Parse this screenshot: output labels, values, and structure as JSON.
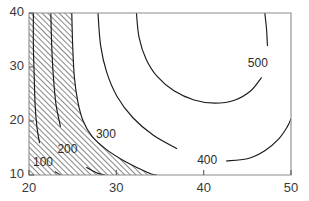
{
  "figure": {
    "kind": "contour-plot",
    "background_color": "#ffffff",
    "frame_color": "#8c8c8c",
    "contour_color": "#1a1a1a",
    "label_color": "#2b2b2b",
    "hatch_angle_degrees": 45,
    "hatch_spacing_px": 4
  },
  "chart_data": {
    "type": "line",
    "subtype": "contour",
    "title": "",
    "subtitle": "",
    "xlabel": "",
    "ylabel": "",
    "xlim": [
      20,
      50
    ],
    "ylim": [
      10,
      40
    ],
    "xticks": [
      20,
      30,
      40,
      50
    ],
    "yticks": [
      10,
      20,
      30,
      40
    ],
    "xtick_labels": [
      "20",
      "30",
      "40",
      "50"
    ],
    "ytick_labels": [
      "10",
      "20",
      "30",
      "40"
    ],
    "grid": false,
    "legend": false,
    "legend_position": "none",
    "contour_levels": [
      100,
      200,
      300,
      400,
      500
    ],
    "level_labels": [
      "100",
      "200",
      "300",
      "400",
      "500"
    ],
    "hatched_levels": [
      100,
      200,
      300
    ],
    "hatched_region_note": "region left of and below the 300 contour is hatched",
    "series": [
      {
        "name": "100",
        "label": "100",
        "label_xy": [
          21.6,
          12.2
        ],
        "points": [
          [
            20.5,
            40.0
          ],
          [
            20.5,
            34.0
          ],
          [
            20.6,
            28.0
          ],
          [
            20.7,
            23.0
          ],
          [
            20.9,
            19.0
          ],
          [
            21.2,
            16.0
          ],
          [
            21.7,
            13.6
          ],
          [
            22.3,
            11.8
          ],
          [
            23.0,
            10.6
          ],
          [
            23.6,
            10.0
          ]
        ]
      },
      {
        "name": "200",
        "label": "200",
        "label_xy": [
          24.4,
          14.6
        ],
        "points": [
          [
            22.5,
            40.0
          ],
          [
            22.6,
            34.0
          ],
          [
            22.8,
            28.0
          ],
          [
            23.1,
            23.0
          ],
          [
            23.6,
            19.0
          ],
          [
            24.3,
            15.8
          ],
          [
            25.3,
            13.2
          ],
          [
            26.6,
            11.4
          ],
          [
            27.9,
            10.3
          ],
          [
            28.7,
            10.0
          ]
        ]
      },
      {
        "name": "300",
        "label": "300",
        "label_xy": [
          28.8,
          17.4
        ],
        "points": [
          [
            24.9,
            40.0
          ],
          [
            25.0,
            34.0
          ],
          [
            25.2,
            28.0
          ],
          [
            25.6,
            23.5
          ],
          [
            26.2,
            20.0
          ],
          [
            27.2,
            17.2
          ],
          [
            28.8,
            14.8
          ],
          [
            30.8,
            12.7
          ],
          [
            32.6,
            11.2
          ],
          [
            34.0,
            10.2
          ],
          [
            34.6,
            10.0
          ]
        ]
      },
      {
        "name": "400",
        "label": "400",
        "label_xy": [
          40.4,
          12.6
        ],
        "points": [
          [
            27.9,
            40.0
          ],
          [
            28.2,
            34.0
          ],
          [
            28.9,
            29.0
          ],
          [
            30.1,
            24.5
          ],
          [
            31.9,
            20.6
          ],
          [
            34.2,
            17.4
          ],
          [
            36.9,
            14.9
          ],
          [
            39.8,
            13.3
          ],
          [
            42.6,
            12.6
          ],
          [
            45.0,
            13.0
          ],
          [
            47.0,
            14.5
          ],
          [
            48.6,
            16.7
          ],
          [
            49.6,
            19.0
          ],
          [
            50.0,
            20.4
          ]
        ]
      },
      {
        "name": "500",
        "label": "500",
        "label_xy": [
          46.2,
          30.6
        ],
        "points": [
          [
            32.3,
            40.0
          ],
          [
            32.6,
            35.5
          ],
          [
            33.4,
            31.5
          ],
          [
            34.7,
            28.2
          ],
          [
            36.6,
            25.6
          ],
          [
            38.9,
            23.9
          ],
          [
            41.3,
            23.3
          ],
          [
            43.6,
            23.9
          ],
          [
            45.4,
            25.6
          ],
          [
            46.6,
            28.0
          ],
          [
            47.2,
            30.8
          ],
          [
            47.3,
            34.0
          ],
          [
            47.2,
            37.0
          ],
          [
            47.0,
            40.0
          ]
        ]
      }
    ]
  },
  "axes": {
    "x_axis": {
      "name": "x-axis",
      "ticks": [
        {
          "value": 20,
          "label": "20"
        },
        {
          "value": 30,
          "label": "30"
        },
        {
          "value": 40,
          "label": "40"
        },
        {
          "value": 50,
          "label": "50"
        }
      ]
    },
    "y_axis": {
      "name": "y-axis",
      "ticks": [
        {
          "value": 10,
          "label": "10"
        },
        {
          "value": 20,
          "label": "20"
        },
        {
          "value": 30,
          "label": "30"
        },
        {
          "value": 40,
          "label": "40"
        }
      ]
    }
  }
}
